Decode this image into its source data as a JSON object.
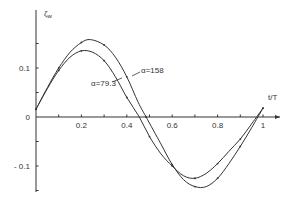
{
  "chart_data": {
    "type": "line",
    "title": "",
    "xlabel": "t/T",
    "ylabel": "ζw",
    "xlim": [
      0,
      1.05
    ],
    "ylim": [
      -0.16,
      0.2
    ],
    "grid": false,
    "legend": "inline labels",
    "x_ticks": [
      0.1,
      0.2,
      0.3,
      0.4,
      0.5,
      0.6,
      0.7,
      0.8,
      0.9,
      1.0
    ],
    "x_tick_labels": [
      {
        "value": 0.2,
        "label": "0.2"
      },
      {
        "value": 0.4,
        "label": "0.4"
      },
      {
        "value": 0.6,
        "label": "0.6"
      },
      {
        "value": 0.8,
        "label": "0.8"
      },
      {
        "value": 1.0,
        "label": "1"
      }
    ],
    "y_ticks": [
      -0.15,
      -0.1,
      -0.05,
      0.05,
      0.1,
      0.15
    ],
    "y_tick_labels": [
      {
        "value": 0.1,
        "label": "0.1"
      },
      {
        "value": 0,
        "label": "0"
      },
      {
        "value": -0.1,
        "label": "- 0.1"
      }
    ],
    "series": [
      {
        "name": "α=158",
        "label": "α=158",
        "x": [
          0,
          0.05,
          0.1,
          0.15,
          0.2,
          0.24,
          0.3,
          0.35,
          0.4,
          0.45,
          0.485,
          0.55,
          0.6,
          0.65,
          0.7,
          0.75,
          0.8,
          0.85,
          0.9,
          0.95,
          1.0
        ],
        "values": [
          0.016,
          0.06,
          0.1,
          0.132,
          0.152,
          0.158,
          0.147,
          0.122,
          0.082,
          0.03,
          0,
          -0.055,
          -0.097,
          -0.128,
          -0.142,
          -0.142,
          -0.125,
          -0.095,
          -0.06,
          -0.022,
          0.018
        ]
      },
      {
        "name": "α=79.3",
        "label": "α=79.3",
        "x": [
          0,
          0.05,
          0.1,
          0.15,
          0.2,
          0.25,
          0.3,
          0.35,
          0.4,
          0.455,
          0.5,
          0.55,
          0.6,
          0.65,
          0.7,
          0.75,
          0.8,
          0.85,
          0.9,
          0.95,
          1.0
        ],
        "values": [
          0.016,
          0.058,
          0.095,
          0.122,
          0.135,
          0.132,
          0.115,
          0.082,
          0.04,
          0,
          -0.04,
          -0.075,
          -0.1,
          -0.12,
          -0.125,
          -0.115,
          -0.095,
          -0.07,
          -0.045,
          -0.014,
          0.018
        ]
      }
    ],
    "annotations": [
      {
        "text": "α=158",
        "x": 0.42,
        "y": 0.12
      },
      {
        "text": "α=79.3",
        "x": 0.35,
        "y": 0.07
      }
    ]
  }
}
